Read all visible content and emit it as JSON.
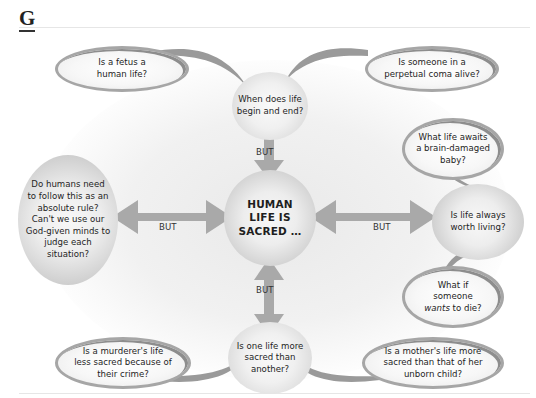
{
  "heading": "G",
  "center": {
    "line1": "HUMAN",
    "line2": "LIFE IS",
    "line3": "SACRED …"
  },
  "connector_label": "BUT",
  "nodes": {
    "top": {
      "line1": "When does life",
      "line2": "begin and end?"
    },
    "left": {
      "line1": "Do humans need",
      "line2": "to follow this as an",
      "line3": "absolute rule?",
      "line4": "Can't we use our",
      "line5": "God-given minds to",
      "line6": "judge each",
      "line7": "situation?"
    },
    "right": {
      "line1": "Is life always",
      "line2": "worth living?"
    },
    "bottom": {
      "line1": "Is one life more",
      "line2": "sacred than",
      "line3": "another?"
    }
  },
  "bubbles": {
    "top_left": {
      "line1": "Is a fetus a",
      "line2": "human life?"
    },
    "top_right": {
      "line1": "Is someone in a",
      "line2": "perpetual coma alive?"
    },
    "right_upper": {
      "line1": "What life awaits",
      "line2": "a brain-damaged",
      "line3": "baby?"
    },
    "right_lower": {
      "line1": "What if",
      "line2": "someone",
      "line3_em": "wants",
      "line3_rest": " to die?"
    },
    "bottom_left": {
      "line1": "Is a murderer's life",
      "line2": "less sacred because of",
      "line3": "their crime?"
    },
    "bottom_right": {
      "line1": "Is a mother's life more",
      "line2": "sacred than that of her",
      "line3": "unborn child?"
    }
  },
  "colors": {
    "arrow": "#a9a9a9",
    "bubble_border": "#a6a6a6",
    "sphere_edge": "#b8b8b8",
    "text": "#1e1e1e"
  }
}
